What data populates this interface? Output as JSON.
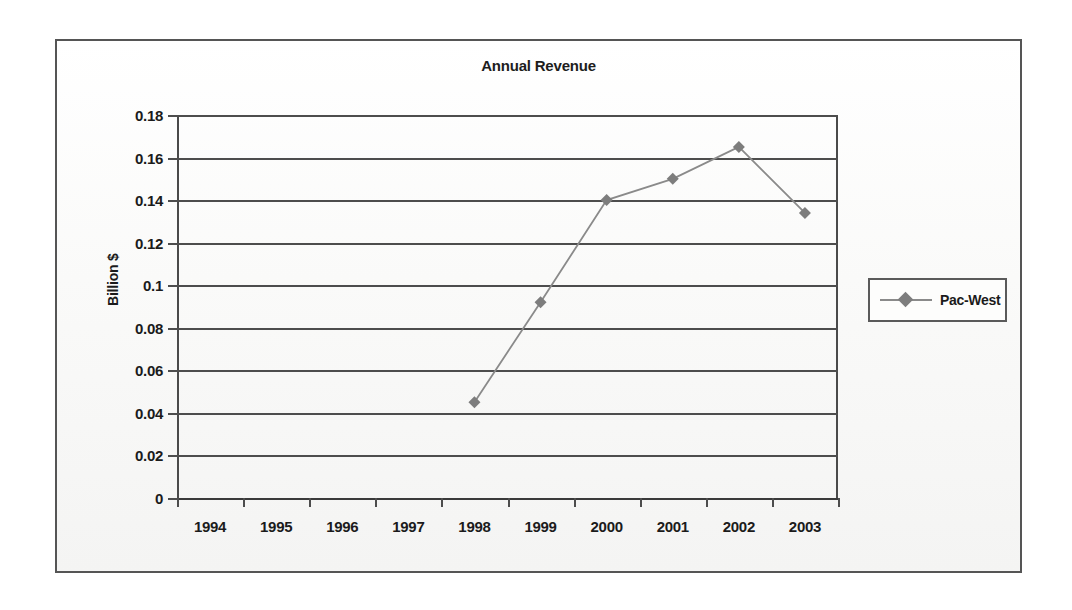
{
  "chart_data": {
    "type": "line",
    "title": "Annual Revenue",
    "xlabel": "",
    "ylabel": "Billion $",
    "categories": [
      "1994",
      "1995",
      "1996",
      "1997",
      "1998",
      "1999",
      "2000",
      "2001",
      "2002",
      "2003"
    ],
    "series": [
      {
        "name": "Pac-West",
        "values": [
          null,
          null,
          null,
          null,
          0.045,
          0.092,
          0.14,
          0.15,
          0.165,
          0.134
        ]
      }
    ],
    "ylim": [
      0,
      0.18
    ],
    "ytick_values": [
      0,
      0.02,
      0.04,
      0.06,
      0.08,
      0.1,
      0.12,
      0.14,
      0.16,
      0.18
    ],
    "ytick_labels": [
      "0",
      "0.02",
      "0.04",
      "0.06",
      "0.08",
      "0.1",
      "0.12",
      "0.14",
      "0.16",
      "0.18"
    ],
    "grid": "horizontal",
    "legend_position": "right",
    "marker": "diamond",
    "series_color": "#7d7d7d",
    "line_color": "#8a8a8a",
    "axis_color": "#4d4d4d",
    "text_color": "#1b1b1b",
    "background_color": "#fbfbfa"
  },
  "legend": {
    "entries": [
      {
        "label": "Pac-West"
      }
    ]
  }
}
